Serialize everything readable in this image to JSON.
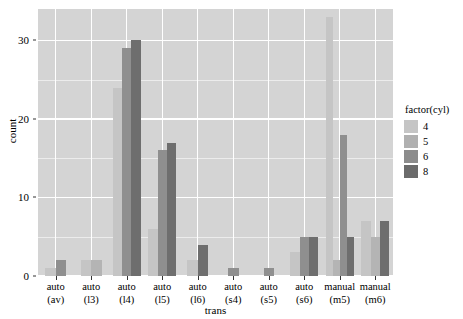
{
  "chart_data": {
    "type": "bar",
    "title": "",
    "xlabel": "trans",
    "ylabel": "count",
    "ylim": [
      0,
      34
    ],
    "yticks": [
      0,
      10,
      20,
      30
    ],
    "grid": true,
    "legend_position": "right",
    "legend_title": "factor(cyl)",
    "bar_mode": "dodge",
    "categories": [
      "auto\n(av)",
      "auto\n(l3)",
      "auto\n(l4)",
      "auto\n(l5)",
      "auto\n(l6)",
      "auto\n(s4)",
      "auto\n(s5)",
      "auto\n(s6)",
      "manual\n(m5)",
      "manual\n(m6)"
    ],
    "category_lines": [
      [
        "auto",
        "(av)"
      ],
      [
        "auto",
        "(l3)"
      ],
      [
        "auto",
        "(l4)"
      ],
      [
        "auto",
        "(l5)"
      ],
      [
        "auto",
        "(l6)"
      ],
      [
        "auto",
        "(s4)"
      ],
      [
        "auto",
        "(s5)"
      ],
      [
        "auto",
        "(s6)"
      ],
      [
        "manual",
        "(m5)"
      ],
      [
        "manual",
        "(m6)"
      ]
    ],
    "series": [
      {
        "name": "4",
        "color": "#c5c5c5",
        "values": [
          1,
          2,
          0,
          0,
          0,
          0,
          0,
          2,
          33,
          7
        ]
      },
      {
        "name": "5",
        "color": "#b4b4b4",
        "values": [
          0,
          2,
          0,
          0,
          0,
          0,
          0,
          0,
          2,
          0
        ]
      },
      {
        "name": "6",
        "color": "#8f8f8f",
        "values": [
          2,
          0,
          24,
          16,
          2,
          1,
          1,
          5,
          18,
          5
        ]
      },
      {
        "name": "8",
        "color": "#6e6e6e",
        "values": [
          0,
          0,
          29,
          17,
          4,
          0,
          0,
          5,
          5,
          7
        ]
      }
    ],
    "extra_series_note": "l4 has a 4th dark bar at 30",
    "groups": [
      {
        "category": 0,
        "bars": [
          {
            "series": "4",
            "value": 1
          },
          {
            "series": "6",
            "value": 2
          }
        ]
      },
      {
        "category": 1,
        "bars": [
          {
            "series": "4",
            "value": 2
          },
          {
            "series": "5",
            "value": 2
          }
        ]
      },
      {
        "category": 2,
        "bars": [
          {
            "series": "4",
            "value": 24
          },
          {
            "series": "6",
            "value": 29
          },
          {
            "series": "8",
            "value": 30
          }
        ]
      },
      {
        "category": 3,
        "bars": [
          {
            "series": "4",
            "value": 6
          },
          {
            "series": "6",
            "value": 16
          },
          {
            "series": "8",
            "value": 17
          }
        ]
      },
      {
        "category": 4,
        "bars": [
          {
            "series": "4",
            "value": 2
          },
          {
            "series": "8",
            "value": 4
          }
        ]
      },
      {
        "category": 5,
        "bars": [
          {
            "series": "6",
            "value": 1
          }
        ]
      },
      {
        "category": 6,
        "bars": [
          {
            "series": "6",
            "value": 1
          }
        ]
      },
      {
        "category": 7,
        "bars": [
          {
            "series": "4",
            "value": 3
          },
          {
            "series": "6",
            "value": 5
          },
          {
            "series": "8",
            "value": 5
          }
        ]
      },
      {
        "category": 8,
        "bars": [
          {
            "series": "4",
            "value": 33
          },
          {
            "series": "5",
            "value": 2
          },
          {
            "series": "6",
            "value": 18
          },
          {
            "series": "8",
            "value": 5
          }
        ]
      },
      {
        "category": 9,
        "bars": [
          {
            "series": "4",
            "value": 7
          },
          {
            "series": "5",
            "value": 5
          },
          {
            "series": "8",
            "value": 7
          }
        ]
      }
    ],
    "legend_items": [
      {
        "label": "4",
        "color": "#c5c5c5"
      },
      {
        "label": "5",
        "color": "#b0b0b0"
      },
      {
        "label": "6",
        "color": "#8c8c8c"
      },
      {
        "label": "8",
        "color": "#6b6b6b"
      }
    ],
    "panel_background": "#d4d4d4",
    "gridline_color": "#ffffff"
  }
}
